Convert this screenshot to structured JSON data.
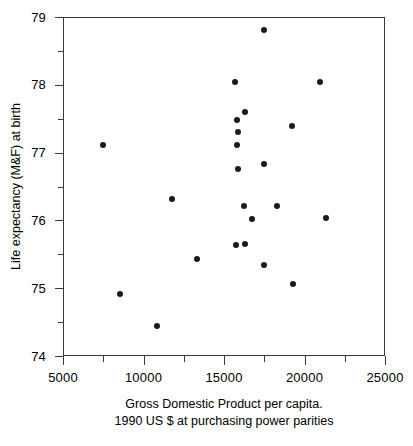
{
  "chart_data": {
    "type": "scatter",
    "title": "",
    "xlabel": "Gross Domestic Product per capita.",
    "xlabel_line2": "1990 US $ at purchasing power parities",
    "ylabel": "Life expectancy (M&F) at birth",
    "xlim": [
      5000,
      25000
    ],
    "ylim": [
      74,
      79
    ],
    "xticks": [
      5000,
      10000,
      15000,
      20000,
      25000
    ],
    "xtick_labels": [
      "5000",
      "10000",
      "15000",
      "20000",
      "25000"
    ],
    "xminor_ticks": [
      7500,
      12500,
      17500,
      22500
    ],
    "yticks": [
      74,
      75,
      76,
      77,
      78,
      79
    ],
    "ytick_labels": [
      "74",
      "75",
      "76",
      "77",
      "78",
      "79"
    ],
    "yminor_ticks": [
      74.5,
      75.5,
      76.5,
      77.5,
      78.5
    ],
    "grid": false,
    "legend": null,
    "marker_color": "#1a1a1a",
    "frame_color": "#3a3a3a",
    "background": "#ffffff",
    "points": [
      {
        "x": 7450,
        "y": 77.12
      },
      {
        "x": 8500,
        "y": 74.93
      },
      {
        "x": 10800,
        "y": 74.45
      },
      {
        "x": 11700,
        "y": 76.33
      },
      {
        "x": 13250,
        "y": 75.44
      },
      {
        "x": 15650,
        "y": 78.05
      },
      {
        "x": 15720,
        "y": 77.5
      },
      {
        "x": 15780,
        "y": 77.32
      },
      {
        "x": 15720,
        "y": 77.12
      },
      {
        "x": 15780,
        "y": 76.77
      },
      {
        "x": 15700,
        "y": 75.65
      },
      {
        "x": 16250,
        "y": 77.62
      },
      {
        "x": 16200,
        "y": 76.22
      },
      {
        "x": 16250,
        "y": 75.66
      },
      {
        "x": 16650,
        "y": 76.03
      },
      {
        "x": 17400,
        "y": 78.82
      },
      {
        "x": 17450,
        "y": 76.85
      },
      {
        "x": 17450,
        "y": 75.35
      },
      {
        "x": 18250,
        "y": 76.22
      },
      {
        "x": 19150,
        "y": 77.4
      },
      {
        "x": 19250,
        "y": 75.07
      },
      {
        "x": 20900,
        "y": 78.06
      },
      {
        "x": 21300,
        "y": 76.05
      }
    ]
  }
}
